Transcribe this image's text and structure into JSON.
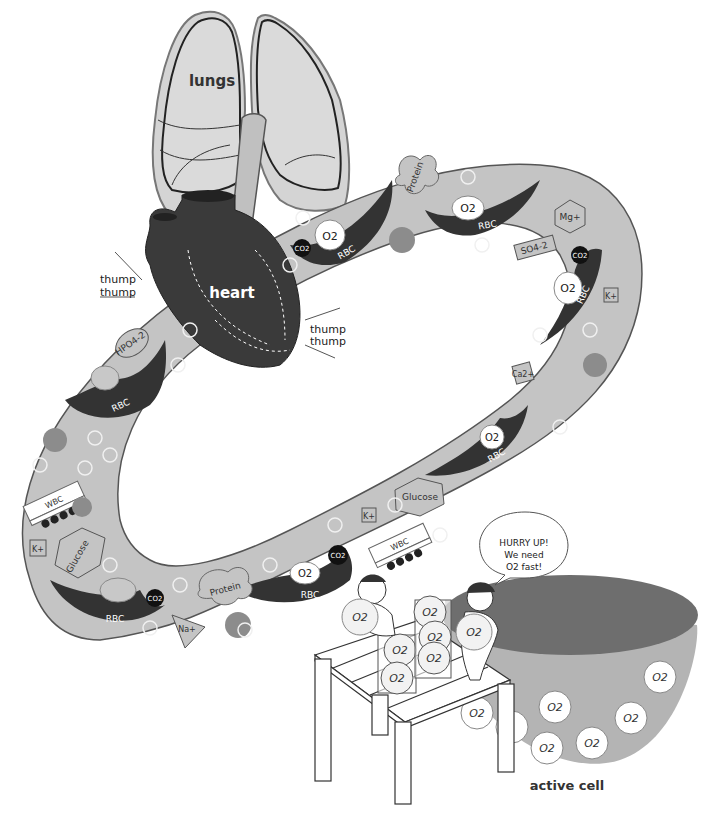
{
  "colors": {
    "vessel": "#c4c4c4",
    "vessel_outline": "#555555",
    "organ_dark": "#3a3a3a",
    "lung_fill": "#d2d2d2",
    "rbc": "#333333",
    "hco3": "#8c8c8c",
    "cell_top": "#6e6e6e",
    "cell_body": "#b4b4b4",
    "background": "#ffffff"
  },
  "organs": {
    "lungs": "lungs",
    "heart": "heart",
    "cell": "active cell"
  },
  "heartbeat": {
    "left": [
      "thump",
      "thump"
    ],
    "right": [
      "thump",
      "thump"
    ]
  },
  "blood_components": {
    "rbc": "RBC",
    "wbc": "WBC",
    "o2": "O2",
    "co2": "CO2",
    "protein": "Protein",
    "glucose": "Glucose",
    "hco3": "HCO3-",
    "hpo4": "HPO4-2",
    "so4": "SO4-2",
    "mg": "Mg+",
    "k": "K+",
    "ca": "Ca2+",
    "na": "Na+"
  },
  "speech_bubble": {
    "line1": "HURRY UP!",
    "line2": "We need",
    "line3": "O2 fast!"
  },
  "o2_label": "O2"
}
